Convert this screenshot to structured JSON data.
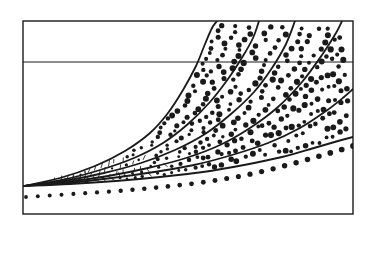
{
  "figure": {
    "kind": "scanned-line-chart",
    "background_color": "#ffffff",
    "ink_color": "#1a1a1a",
    "has_axis_labels": false,
    "has_tick_labels": false,
    "has_title": false,
    "has_legend": false,
    "plot_frame": {
      "x0": 23,
      "y0": 21,
      "x1": 353,
      "y1": 214,
      "border_color": "#1a1a1a",
      "border_width": 1.4
    },
    "gridlines": {
      "horizontal": [
        {
          "name": "upper-horizontal-gridline",
          "y": 62,
          "x_start": 23,
          "x_end": 353,
          "width": 1.0
        }
      ],
      "vertical": []
    }
  },
  "chart_data": {
    "type": "line",
    "title": "",
    "subtitle": "",
    "xlabel": "",
    "ylabel": "",
    "xlim": [
      23,
      353
    ],
    "ylim": [
      214,
      21
    ],
    "grid": true,
    "grid_lines_y": [
      62
    ],
    "legend": "none",
    "annotations": [],
    "series": [
      {
        "name": "solid-curve-1",
        "style": "solid",
        "stroke_width": 1.8,
        "exits": "top-edge",
        "points": [
          [
            24,
            186
          ],
          [
            60,
            178
          ],
          [
            95,
            166
          ],
          [
            125,
            151
          ],
          [
            150,
            133
          ],
          [
            168,
            113
          ],
          [
            183,
            90
          ],
          [
            196,
            66
          ],
          [
            205,
            44
          ],
          [
            212,
            28
          ],
          [
            217,
            21
          ]
        ]
      },
      {
        "name": "solid-curve-2",
        "style": "solid",
        "stroke_width": 1.8,
        "exits": "top-edge",
        "points": [
          [
            24,
            186
          ],
          [
            62,
            180
          ],
          [
            100,
            170
          ],
          [
            134,
            158
          ],
          [
            163,
            143
          ],
          [
            188,
            124
          ],
          [
            210,
            102
          ],
          [
            228,
            79
          ],
          [
            243,
            56
          ],
          [
            253,
            38
          ],
          [
            259,
            21
          ]
        ]
      },
      {
        "name": "solid-curve-3",
        "style": "solid",
        "stroke_width": 1.8,
        "exits": "top-edge",
        "points": [
          [
            24,
            186
          ],
          [
            64,
            181
          ],
          [
            104,
            173
          ],
          [
            141,
            163
          ],
          [
            175,
            150
          ],
          [
            205,
            134
          ],
          [
            231,
            114
          ],
          [
            254,
            92
          ],
          [
            272,
            68
          ],
          [
            286,
            44
          ],
          [
            295,
            21
          ]
        ]
      },
      {
        "name": "solid-curve-4",
        "style": "solid",
        "stroke_width": 1.8,
        "exits": "top-edge",
        "points": [
          [
            24,
            186
          ],
          [
            66,
            182
          ],
          [
            108,
            176
          ],
          [
            148,
            168
          ],
          [
            186,
            158
          ],
          [
            220,
            145
          ],
          [
            250,
            128
          ],
          [
            278,
            107
          ],
          [
            302,
            82
          ],
          [
            322,
            55
          ],
          [
            336,
            33
          ],
          [
            342,
            21
          ]
        ]
      },
      {
        "name": "solid-curve-5",
        "style": "solid",
        "stroke_width": 1.8,
        "exits": "right-edge",
        "points": [
          [
            24,
            186
          ],
          [
            68,
            183
          ],
          [
            112,
            178
          ],
          [
            154,
            172
          ],
          [
            194,
            165
          ],
          [
            232,
            155
          ],
          [
            268,
            143
          ],
          [
            300,
            128
          ],
          [
            326,
            111
          ],
          [
            344,
            97
          ],
          [
            353,
            89
          ]
        ]
      },
      {
        "name": "solid-curve-6",
        "style": "solid",
        "stroke_width": 1.9,
        "exits": "right-edge",
        "points": [
          [
            24,
            186
          ],
          [
            70,
            184
          ],
          [
            116,
            181
          ],
          [
            160,
            177
          ],
          [
            203,
            172
          ],
          [
            244,
            165
          ],
          [
            282,
            157
          ],
          [
            314,
            148
          ],
          [
            338,
            141
          ],
          [
            353,
            137
          ]
        ]
      },
      {
        "name": "heavy-dotted-boundary-curve",
        "style": "dotted",
        "dot_radius_start": 1.9,
        "dot_radius_end": 2.9,
        "dot_count": 28,
        "exits": "right-edge",
        "points": [
          [
            26,
            197
          ],
          [
            72,
            194
          ],
          [
            118,
            191
          ],
          [
            162,
            187
          ],
          [
            205,
            182
          ],
          [
            246,
            175
          ],
          [
            284,
            166
          ],
          [
            316,
            157
          ],
          [
            340,
            150
          ],
          [
            353,
            146
          ]
        ]
      }
    ],
    "stipple_bands": [
      {
        "name": "band-1",
        "between": [
          "solid-curve-1",
          "solid-curve-2"
        ],
        "fill": "graded-dot-stipple"
      },
      {
        "name": "band-2",
        "between": [
          "solid-curve-2",
          "solid-curve-3"
        ],
        "fill": "graded-dot-stipple"
      },
      {
        "name": "band-3",
        "between": [
          "solid-curve-3",
          "solid-curve-4"
        ],
        "fill": "graded-dot-stipple"
      },
      {
        "name": "band-4",
        "between": [
          "solid-curve-4",
          "solid-curve-5"
        ],
        "fill": "graded-dot-stipple"
      },
      {
        "name": "band-5",
        "between": [
          "solid-curve-5",
          "solid-curve-6"
        ],
        "fill": "sparse-dash-stipple"
      }
    ]
  }
}
